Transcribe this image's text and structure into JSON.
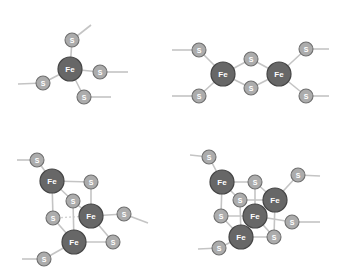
{
  "diagram": {
    "title": "",
    "colors": {
      "fe_fill": "#676767",
      "fe_stroke": "#454545",
      "s_fill": "#acacac",
      "s_stroke": "#6f6f6f",
      "bond": "#c4c4c4",
      "label": "#ffffff"
    },
    "atom_labels": {
      "fe": "Fe",
      "s": "S"
    },
    "clusters": [
      {
        "id": "rubredoxin-fe",
        "name": "Fe (single iron, 4 S)",
        "atoms": [
          {
            "el": "S",
            "x": 72,
            "y": 40
          },
          {
            "el": "S",
            "x": 100,
            "y": 72
          },
          {
            "el": "S",
            "x": 84,
            "y": 97
          },
          {
            "el": "S",
            "x": 43,
            "y": 83
          },
          {
            "el": "Fe",
            "x": 70,
            "y": 69
          }
        ],
        "bonds": [
          [
            70,
            69,
            72,
            40
          ],
          [
            70,
            69,
            100,
            72
          ],
          [
            70,
            69,
            84,
            97
          ],
          [
            70,
            69,
            43,
            83
          ],
          [
            72,
            40,
            91,
            25
          ],
          [
            100,
            72,
            128,
            72
          ],
          [
            84,
            97,
            111,
            97
          ],
          [
            43,
            83,
            18,
            84
          ]
        ]
      },
      {
        "id": "2fe-2s",
        "name": "2Fe-2S",
        "atoms": [
          {
            "el": "S",
            "x": 199,
            "y": 50
          },
          {
            "el": "S",
            "x": 199,
            "y": 96
          },
          {
            "el": "S",
            "x": 251,
            "y": 59
          },
          {
            "el": "S",
            "x": 251,
            "y": 88
          },
          {
            "el": "S",
            "x": 306,
            "y": 49
          },
          {
            "el": "S",
            "x": 306,
            "y": 96
          },
          {
            "el": "Fe",
            "x": 223,
            "y": 74
          },
          {
            "el": "Fe",
            "x": 279,
            "y": 74
          }
        ],
        "bonds": [
          [
            223,
            74,
            199,
            50
          ],
          [
            223,
            74,
            199,
            96
          ],
          [
            223,
            74,
            251,
            59
          ],
          [
            223,
            74,
            251,
            88
          ],
          [
            279,
            74,
            251,
            59
          ],
          [
            279,
            74,
            251,
            88
          ],
          [
            279,
            74,
            306,
            49
          ],
          [
            279,
            74,
            306,
            96
          ],
          [
            199,
            50,
            172,
            50
          ],
          [
            199,
            96,
            172,
            96
          ],
          [
            306,
            49,
            329,
            49
          ],
          [
            306,
            96,
            329,
            96
          ]
        ]
      },
      {
        "id": "3fe-4s",
        "name": "3Fe-4S",
        "atoms": [
          {
            "el": "S",
            "x": 37,
            "y": 160
          },
          {
            "el": "S",
            "x": 91,
            "y": 182
          },
          {
            "el": "S",
            "x": 73,
            "y": 201
          },
          {
            "el": "S",
            "x": 53,
            "y": 218
          },
          {
            "el": "S",
            "x": 124,
            "y": 214
          },
          {
            "el": "S",
            "x": 113,
            "y": 242
          },
          {
            "el": "S",
            "x": 44,
            "y": 259
          },
          {
            "el": "Fe",
            "x": 52,
            "y": 181
          },
          {
            "el": "Fe",
            "x": 91,
            "y": 216
          },
          {
            "el": "Fe",
            "x": 74,
            "y": 242
          }
        ],
        "bonds": [
          [
            52,
            181,
            91,
            182
          ],
          [
            52,
            181,
            73,
            201
          ],
          [
            52,
            181,
            53,
            218
          ],
          [
            91,
            182,
            91,
            216
          ],
          [
            73,
            201,
            91,
            216
          ],
          [
            73,
            201,
            74,
            242
          ],
          [
            53,
            218,
            74,
            242
          ],
          [
            91,
            216,
            113,
            242
          ],
          [
            74,
            242,
            113,
            242
          ],
          [
            91,
            216,
            124,
            214
          ],
          [
            74,
            242,
            44,
            259
          ],
          [
            52,
            181,
            37,
            160
          ],
          [
            37,
            160,
            17,
            160
          ],
          [
            124,
            214,
            148,
            223
          ],
          [
            44,
            259,
            22,
            259
          ]
        ],
        "back_bonds": [
          [
            53,
            218,
            91,
            216
          ]
        ]
      },
      {
        "id": "4fe-4s",
        "name": "4Fe-4S",
        "atoms": [
          {
            "el": "S",
            "x": 209,
            "y": 157
          },
          {
            "el": "S",
            "x": 298,
            "y": 175
          },
          {
            "el": "S",
            "x": 255,
            "y": 182
          },
          {
            "el": "S",
            "x": 240,
            "y": 200
          },
          {
            "el": "S",
            "x": 221,
            "y": 216
          },
          {
            "el": "S",
            "x": 292,
            "y": 222
          },
          {
            "el": "S",
            "x": 274,
            "y": 237
          },
          {
            "el": "S",
            "x": 219,
            "y": 248
          },
          {
            "el": "Fe",
            "x": 222,
            "y": 182
          },
          {
            "el": "Fe",
            "x": 275,
            "y": 200
          },
          {
            "el": "Fe",
            "x": 255,
            "y": 216
          },
          {
            "el": "Fe",
            "x": 241,
            "y": 237
          }
        ],
        "bonds": [
          [
            222,
            182,
            255,
            182
          ],
          [
            222,
            182,
            240,
            200
          ],
          [
            222,
            182,
            221,
            216
          ],
          [
            255,
            182,
            275,
            200
          ],
          [
            255,
            182,
            255,
            216
          ],
          [
            240,
            200,
            275,
            200
          ],
          [
            240,
            200,
            241,
            237
          ],
          [
            221,
            216,
            255,
            216
          ],
          [
            221,
            216,
            241,
            237
          ],
          [
            275,
            200,
            274,
            237
          ],
          [
            255,
            216,
            274,
            237
          ],
          [
            241,
            237,
            274,
            237
          ],
          [
            222,
            182,
            209,
            157
          ],
          [
            209,
            157,
            190,
            155
          ],
          [
            275,
            200,
            298,
            175
          ],
          [
            298,
            175,
            320,
            176
          ],
          [
            255,
            216,
            292,
            222
          ],
          [
            292,
            222,
            320,
            222
          ],
          [
            241,
            237,
            219,
            248
          ],
          [
            219,
            248,
            198,
            249
          ]
        ],
        "back_bonds": []
      }
    ]
  }
}
